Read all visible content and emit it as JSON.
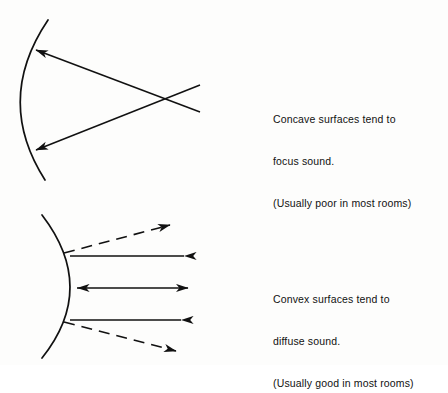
{
  "figure": {
    "background_color": "#fdfdfc",
    "ink_color": "#111111",
    "stroke_width": 1.6
  },
  "panels": [
    {
      "id": "concave",
      "surface_type": "concave",
      "surface_label": "concave-surface-arc",
      "description": "Arc bowing left with two rays converging to a focal point at right",
      "caption": {
        "line1": "Concave surfaces tend to",
        "line2": "focus sound.",
        "line3": "(Usually poor in most rooms)"
      },
      "arc": {
        "start": [
          48,
          20
        ],
        "control": [
          -6,
          100
        ],
        "end": [
          45,
          180
        ]
      },
      "rays": [
        {
          "name": "upper-ray",
          "style": "solid",
          "from": [
            200,
            112
          ],
          "to": [
            34,
            50
          ],
          "arrowheads": [
            "end"
          ]
        },
        {
          "name": "lower-ray",
          "style": "solid",
          "from": [
            200,
            85
          ],
          "to": [
            34,
            150
          ],
          "arrowheads": [
            "end"
          ]
        }
      ],
      "focal_point": [
        177,
        97
      ]
    },
    {
      "id": "convex",
      "surface_type": "convex",
      "surface_label": "convex-surface-arc",
      "description": "Arc bulging right with rays diffusing outward, two dashed diverging rays",
      "caption": {
        "line1": "Convex surfaces tend to",
        "line2": "diffuse sound.",
        "line3": "(Usually good in most rooms)"
      },
      "arc": {
        "start": [
          42,
          215
        ],
        "control": [
          98,
          288
        ],
        "end": [
          42,
          358
        ]
      },
      "rays": [
        {
          "name": "dashed-ray-top",
          "style": "dashed",
          "from": [
            64,
            253
          ],
          "to": [
            172,
            224
          ],
          "arrowheads": [
            "end"
          ]
        },
        {
          "name": "solid-ray-upper",
          "style": "solid",
          "from": [
            70,
            256
          ],
          "to": [
            186,
            256
          ],
          "arrowheads": [
            "end-reverse"
          ]
        },
        {
          "name": "solid-ray-middle",
          "style": "solid",
          "from": [
            76,
            288
          ],
          "to": [
            190,
            288
          ],
          "arrowheads": [
            "start-reverse",
            "end"
          ]
        },
        {
          "name": "solid-ray-lower",
          "style": "solid",
          "from": [
            70,
            320
          ],
          "to": [
            183,
            320
          ],
          "arrowheads": [
            "end-reverse"
          ]
        },
        {
          "name": "dashed-ray-bottom",
          "style": "dashed",
          "from": [
            64,
            322
          ],
          "to": [
            178,
            352
          ],
          "arrowheads": [
            "end"
          ]
        }
      ]
    }
  ]
}
